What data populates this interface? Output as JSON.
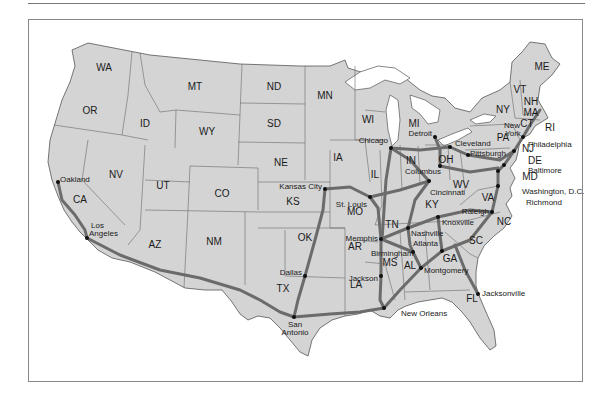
{
  "map": {
    "title": "",
    "state_labels": [
      {
        "id": "WA",
        "x": 104,
        "y": 71
      },
      {
        "id": "OR",
        "x": 90,
        "y": 114
      },
      {
        "id": "ID",
        "x": 145,
        "y": 127
      },
      {
        "id": "MT",
        "x": 195,
        "y": 90
      },
      {
        "id": "WY",
        "x": 207,
        "y": 135
      },
      {
        "id": "ND",
        "x": 274,
        "y": 90
      },
      {
        "id": "SD",
        "x": 274,
        "y": 127
      },
      {
        "id": "NE",
        "x": 281,
        "y": 166
      },
      {
        "id": "MN",
        "x": 325,
        "y": 99
      },
      {
        "id": "WI",
        "x": 368,
        "y": 123
      },
      {
        "id": "IA",
        "x": 338,
        "y": 161
      },
      {
        "id": "IL",
        "x": 375,
        "y": 178
      },
      {
        "id": "MI",
        "x": 414,
        "y": 127
      },
      {
        "id": "IN",
        "x": 411,
        "y": 164
      },
      {
        "id": "OH",
        "x": 446,
        "y": 163
      },
      {
        "id": "NV",
        "x": 116,
        "y": 178
      },
      {
        "id": "UT",
        "x": 163,
        "y": 189
      },
      {
        "id": "CO",
        "x": 222,
        "y": 197
      },
      {
        "id": "KS",
        "x": 293,
        "y": 205
      },
      {
        "id": "MO",
        "x": 355,
        "y": 215
      },
      {
        "id": "KY",
        "x": 432,
        "y": 208
      },
      {
        "id": "WV",
        "x": 461,
        "y": 188
      },
      {
        "id": "VA",
        "x": 488,
        "y": 201
      },
      {
        "id": "CA",
        "x": 80,
        "y": 203
      },
      {
        "id": "AZ",
        "x": 155,
        "y": 248
      },
      {
        "id": "NM",
        "x": 214,
        "y": 245
      },
      {
        "id": "OK",
        "x": 305,
        "y": 241
      },
      {
        "id": "TX",
        "x": 283,
        "y": 292
      },
      {
        "id": "AR",
        "x": 355,
        "y": 250
      },
      {
        "id": "TN",
        "x": 392,
        "y": 228
      },
      {
        "id": "NC",
        "x": 504,
        "y": 225
      },
      {
        "id": "SC",
        "x": 476,
        "y": 244
      },
      {
        "id": "MS",
        "x": 390,
        "y": 266
      },
      {
        "id": "AL",
        "x": 410,
        "y": 269
      },
      {
        "id": "GA",
        "x": 450,
        "y": 262
      },
      {
        "id": "LA",
        "x": 356,
        "y": 288
      },
      {
        "id": "FL",
        "x": 472,
        "y": 302
      },
      {
        "id": "PA",
        "x": 503,
        "y": 141
      },
      {
        "id": "NY",
        "x": 503,
        "y": 113
      },
      {
        "id": "ME",
        "x": 542,
        "y": 70
      },
      {
        "id": "VT",
        "x": 520,
        "y": 93
      },
      {
        "id": "NH",
        "x": 531,
        "y": 105
      },
      {
        "id": "MA",
        "x": 531,
        "y": 116
      },
      {
        "id": "CT",
        "x": 527,
        "y": 127
      },
      {
        "id": "RI",
        "x": 550,
        "y": 131
      },
      {
        "id": "NJ",
        "x": 528,
        "y": 152
      },
      {
        "id": "DE",
        "x": 535,
        "y": 164
      },
      {
        "id": "MD",
        "x": 530,
        "y": 180
      }
    ],
    "cities": [
      {
        "name": "Oakland",
        "x": 58,
        "y": 182,
        "lx": 60,
        "ly": 182,
        "anchor": "start"
      },
      {
        "name": "Los",
        "x": 87,
        "y": 238,
        "lx": 91,
        "ly": 228,
        "anchor": "start"
      },
      {
        "name": "Angeles",
        "x": 87,
        "y": 238,
        "lx": 89,
        "ly": 236,
        "anchor": "start"
      },
      {
        "name": "Kansas City",
        "x": 325,
        "y": 189,
        "lx": 322,
        "ly": 189,
        "anchor": "end"
      },
      {
        "name": "St. Louis",
        "x": 370,
        "y": 197,
        "lx": 367,
        "ly": 207,
        "anchor": "end"
      },
      {
        "name": "Chicago",
        "x": 391,
        "y": 148,
        "lx": 388,
        "ly": 143,
        "anchor": "end"
      },
      {
        "name": "Detroit",
        "x": 435,
        "y": 137,
        "lx": 432,
        "ly": 136,
        "anchor": "end"
      },
      {
        "name": "Cleveland",
        "x": 450,
        "y": 147,
        "lx": 455,
        "ly": 146,
        "anchor": "start"
      },
      {
        "name": "Pittsburgh",
        "x": 468,
        "y": 155,
        "lx": 470,
        "ly": 156,
        "anchor": "start"
      },
      {
        "name": "Columbus",
        "x": 440,
        "y": 166,
        "lx": 405,
        "ly": 174,
        "anchor": "start"
      },
      {
        "name": "Cincinnati",
        "x": 429,
        "y": 181,
        "lx": 430,
        "ly": 195,
        "anchor": "start"
      },
      {
        "name": "New",
        "x": 523,
        "y": 137,
        "lx": 512,
        "ly": 128,
        "anchor": "middle"
      },
      {
        "name": "York",
        "x": 523,
        "y": 137,
        "lx": 513,
        "ly": 136,
        "anchor": "middle"
      },
      {
        "name": "Philadelphia",
        "x": 514,
        "y": 151,
        "lx": 528,
        "ly": 147,
        "anchor": "start"
      },
      {
        "name": "Baltimore",
        "x": 504,
        "y": 165,
        "lx": 528,
        "ly": 173,
        "anchor": "start"
      },
      {
        "name": "Washington, D.C.",
        "x": 498,
        "y": 171,
        "lx": 522,
        "ly": 194,
        "anchor": "start"
      },
      {
        "name": "Richmond",
        "x": 498,
        "y": 186,
        "lx": 526,
        "ly": 205,
        "anchor": "start"
      },
      {
        "name": "Raleigh",
        "x": 492,
        "y": 212,
        "lx": 489,
        "ly": 214,
        "anchor": "end"
      },
      {
        "name": "Knoxville",
        "x": 438,
        "y": 217,
        "lx": 442,
        "ly": 225,
        "anchor": "start"
      },
      {
        "name": "Nashville",
        "x": 408,
        "y": 228,
        "lx": 411,
        "ly": 236,
        "anchor": "start"
      },
      {
        "name": "Memphis",
        "x": 381,
        "y": 239,
        "lx": 378,
        "ly": 241,
        "anchor": "end"
      },
      {
        "name": "Atlanta",
        "x": 442,
        "y": 251,
        "lx": 413,
        "ly": 246,
        "anchor": "start"
      },
      {
        "name": "Birmingham",
        "x": 413,
        "y": 252,
        "lx": 371,
        "ly": 256,
        "anchor": "start"
      },
      {
        "name": "Montgomery",
        "x": 421,
        "y": 268,
        "lx": 424,
        "ly": 273,
        "anchor": "start"
      },
      {
        "name": "Jackson",
        "x": 381,
        "y": 276,
        "lx": 378,
        "ly": 281,
        "anchor": "end"
      },
      {
        "name": "Jacksonville",
        "x": 478,
        "y": 294,
        "lx": 482,
        "ly": 296,
        "anchor": "start"
      },
      {
        "name": "New Orleans",
        "x": 384,
        "y": 308,
        "lx": 401,
        "ly": 316,
        "anchor": "start"
      },
      {
        "name": "Dallas",
        "x": 305,
        "y": 276,
        "lx": 302,
        "ly": 275,
        "anchor": "end"
      },
      {
        "name": "San",
        "x": 294,
        "y": 317,
        "lx": 295,
        "ly": 327,
        "anchor": "middle"
      },
      {
        "name": "Antonio",
        "x": 294,
        "y": 317,
        "lx": 295,
        "ly": 335,
        "anchor": "middle"
      }
    ]
  }
}
